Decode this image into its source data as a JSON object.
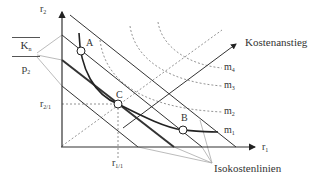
{
  "diagram": {
    "axes": {
      "y_label": "r",
      "y_sub": "2",
      "x_label": "r",
      "x_sub": "1"
    },
    "fraction_label": {
      "numerator": "K",
      "numerator_sub": "n",
      "denominator": "p",
      "denominator_sub": "2"
    },
    "points": {
      "A": "A",
      "B": "B",
      "C": "C"
    },
    "coordinates": {
      "r21_label": "r",
      "r21_sub": "2/1",
      "r11_label": "r",
      "r11_sub": "1/1"
    },
    "isoquant_labels": [
      {
        "label": "m",
        "sub": "4"
      },
      {
        "label": "m",
        "sub": "3"
      },
      {
        "label": "m",
        "sub": "2"
      },
      {
        "label": "m",
        "sub": "1"
      }
    ],
    "arrow_label": "Kostenanstieg",
    "isocost_label": "Isokostenlinien",
    "colors": {
      "line": "#333333",
      "dashed": "#777777",
      "leader": "#aaaaaa"
    }
  }
}
